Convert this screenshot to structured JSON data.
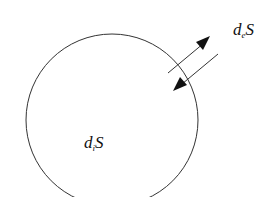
{
  "diagram": {
    "system_boundary": "circle",
    "internal_label": {
      "main": "d",
      "subscript": "i",
      "suffix": "S"
    },
    "external_label": {
      "main": "d",
      "subscript": "e",
      "suffix": "S"
    },
    "arrows": [
      {
        "direction": "outward"
      },
      {
        "direction": "inward"
      }
    ],
    "colors": {
      "stroke": "#333333",
      "text": "#111111",
      "background": "#ffffff"
    }
  }
}
